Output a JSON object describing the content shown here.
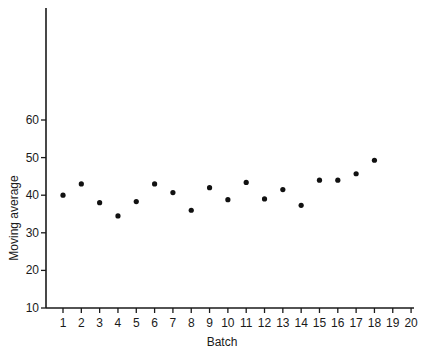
{
  "chart_data": {
    "type": "scatter",
    "title": "",
    "xlabel": "Batch",
    "ylabel": "Moving average",
    "xlim": [
      0,
      20
    ],
    "ylim": [
      10,
      73
    ],
    "x_ticks": [
      1,
      2,
      3,
      4,
      5,
      6,
      7,
      8,
      9,
      10,
      11,
      12,
      13,
      14,
      15,
      16,
      17,
      18,
      19,
      20
    ],
    "y_ticks": [
      10,
      20,
      30,
      40,
      50,
      60
    ],
    "grid": false,
    "legend": null,
    "series": [
      {
        "name": "Moving average",
        "x": [
          1,
          2,
          3,
          4,
          5,
          6,
          7,
          8,
          9,
          10,
          11,
          12,
          13,
          14,
          15,
          16,
          17,
          18
        ],
        "values": [
          40,
          43,
          38,
          34.5,
          38.3,
          43,
          40.7,
          36,
          42,
          38.8,
          43.4,
          39,
          41.5,
          37.3,
          44,
          44,
          45.7,
          49.3
        ]
      }
    ],
    "style": {
      "axis_color": "#1a1a1a",
      "marker_color": "#111111"
    }
  }
}
